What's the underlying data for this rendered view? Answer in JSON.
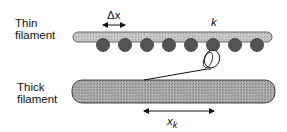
{
  "labels": {
    "thin_filament_line1": "Thin",
    "thin_filament_line2": "filament",
    "thick_filament_line1": "Thick",
    "thick_filament_line2": "filament",
    "delta_x": "Δx",
    "k": "k",
    "x_k_main": "x",
    "x_k_sub": "k"
  },
  "colors": {
    "thin_filament_fill": "#b8b8b8",
    "actin_site_fill": "#5a5a5a",
    "thick_filament_fill": "#9a9a9a",
    "stroke": "#333333"
  },
  "actin_sites_count": 8
}
